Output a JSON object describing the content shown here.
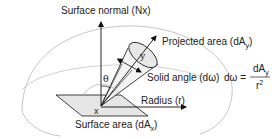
{
  "diagram": {
    "labels": {
      "surface_normal": "Surface normal (Nx)",
      "projected_area": "Projected area (dA",
      "projected_area_sub": "y",
      "projected_area_close": ")",
      "solid_angle": "Solid angle (dω)",
      "radius": "Radius (r)",
      "surface_area": "Surface area (dA",
      "surface_area_sub": "x",
      "surface_area_close": ")",
      "point_x": "x",
      "point_y": "y",
      "theta": "θ"
    },
    "formula": {
      "lhs": "dω =",
      "numerator": "dA",
      "numerator_sub": "y",
      "denominator": "r",
      "denominator_sup": "2"
    },
    "colors": {
      "line": "#111111",
      "dome": "#bbbbbb",
      "surface_fill": "#e6e6e6",
      "cone_fill": "#e8e8e8",
      "text": "#222222"
    }
  }
}
